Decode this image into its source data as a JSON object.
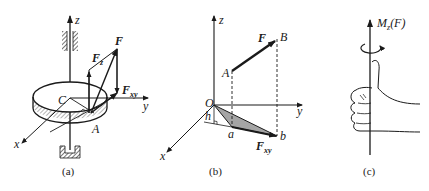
{
  "figure": {
    "panels": [
      {
        "id": "a",
        "caption": "(a)",
        "axis_labels": {
          "z": "z",
          "y": "y",
          "x": "x"
        },
        "point_labels": {
          "center": "C",
          "point": "A"
        },
        "force_labels": {
          "F": "F",
          "Fz": "F",
          "Fz_sub": "z",
          "Fxy": "F",
          "Fxy_sub": "xy"
        }
      },
      {
        "id": "b",
        "caption": "(b)",
        "axis_labels": {
          "z": "z",
          "y": "y",
          "x": "x"
        },
        "point_labels": {
          "origin": "O",
          "A": "A",
          "B": "B",
          "a": "a",
          "b": "b",
          "h": "h"
        },
        "force_labels": {
          "F": "F",
          "Fxy": "F",
          "Fxy_sub": "xy"
        }
      },
      {
        "id": "c",
        "caption": "(c)",
        "moment_label": "M",
        "moment_sub": "z",
        "moment_arg": "(F)"
      }
    ]
  },
  "colors": {
    "ink": "#1a1a1a",
    "background": "#ffffff"
  }
}
